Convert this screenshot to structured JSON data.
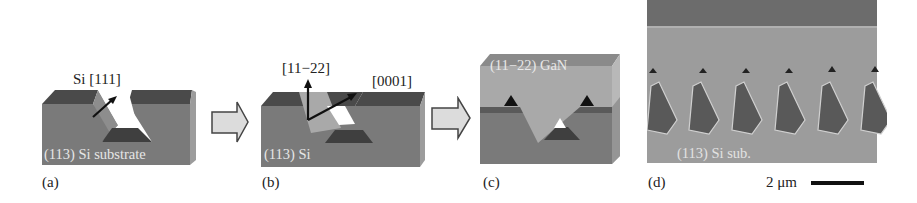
{
  "figure": {
    "panels": [
      {
        "id": "a",
        "caption": "(a)",
        "annotation": "Si [111]",
        "inner_label": "(113) Si substrate"
      },
      {
        "id": "b",
        "caption": "(b)",
        "annotations": [
          "[11−22]",
          "[0001]"
        ],
        "inner_label": "(113) Si"
      },
      {
        "id": "c",
        "caption": "(c)",
        "inner_label": "(11−22) GaN"
      },
      {
        "id": "d",
        "caption": "(d)",
        "inner_label": "(113) Si sub.",
        "scale_bar": "2 μm"
      }
    ],
    "arrows": [
      "process-arrow-1",
      "process-arrow-2"
    ],
    "colors": {
      "substrate_front": "#7c7c7c",
      "substrate_top": "#4e4e4e",
      "substrate_side": "#9a9a9a",
      "gan": "#a9a9a9",
      "gan_top": "#8c8c8c",
      "sem_bg": "#9e9e9e",
      "sem_top_band": "#6e6e6e",
      "arrow_fill": "#dcdcdc",
      "arrow_stroke": "#444444"
    }
  }
}
